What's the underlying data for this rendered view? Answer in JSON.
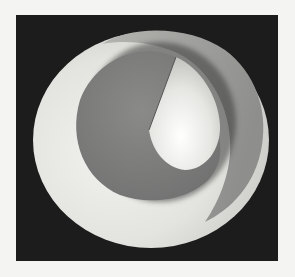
{
  "image": {
    "description": "Rendered grayscale geometric surface: a spiral/conical shell with a wedge cut, on a black square background",
    "background_color": "#1c1c1c",
    "page_color": "#f4f4f2",
    "shapes": {
      "outer_shell_light": "#e6e6e2",
      "outer_ring_gray": "#9a9a98",
      "inner_disk_gray": "#7f7f7f",
      "wedge_highlight": "#f0f0ee"
    }
  }
}
